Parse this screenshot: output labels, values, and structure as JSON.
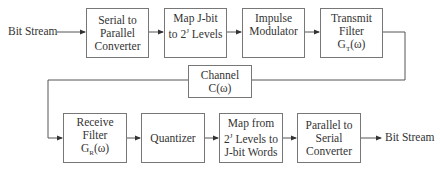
{
  "diagram": {
    "type": "block-diagram",
    "input_label": "Bit Stream",
    "output_label": "Bit Stream",
    "transmitter": [
      {
        "id": "serial-to-parallel",
        "lines": [
          "Serial to",
          "Parallel",
          "Converter"
        ]
      },
      {
        "id": "map-jbit",
        "lines": [
          "Map J-bit",
          "to 2^J Levels"
        ],
        "line1_pre": "Map J-bit",
        "line2_pre": "to 2",
        "line2_sup": "J",
        "line2_post": " Levels"
      },
      {
        "id": "impulse-modulator",
        "lines": [
          "Impulse",
          "Modulator"
        ]
      },
      {
        "id": "transmit-filter",
        "lines": [
          "Transmit",
          "Filter",
          "G_T(ω)"
        ],
        "sym_base": "G",
        "sym_sub": "T",
        "sym_arg": "(ω)"
      }
    ],
    "channel": {
      "id": "channel",
      "lines": [
        "Channel",
        "C(ω)"
      ]
    },
    "receiver": [
      {
        "id": "receive-filter",
        "lines": [
          "Receive",
          "Filter",
          "G_R(ω)"
        ],
        "sym_base": "G",
        "sym_sub": "R",
        "sym_arg": "(ω)"
      },
      {
        "id": "quantizer",
        "lines": [
          "Quantizer"
        ]
      },
      {
        "id": "map-from-levels",
        "lines": [
          "Map from",
          "2^J Levels to",
          "J-bit Words"
        ],
        "line2_pre": "2",
        "line2_sup": "J",
        "line2_post": " Levels to"
      },
      {
        "id": "parallel-to-serial",
        "lines": [
          "Parallel to",
          "Serial",
          "Converter"
        ]
      }
    ],
    "colors": {
      "stroke": "#777777",
      "text": "#333333",
      "arrow": "#333333"
    }
  }
}
